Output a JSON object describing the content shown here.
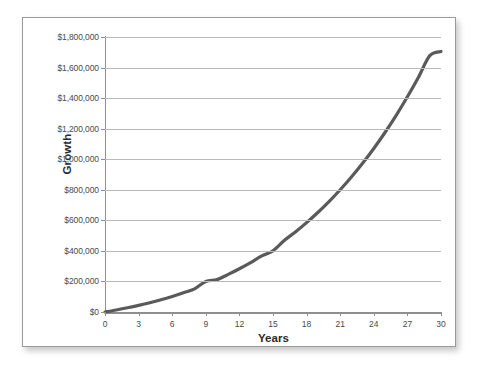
{
  "chart_data": {
    "type": "line",
    "title": "",
    "xlabel": "Years",
    "ylabel": "Growth",
    "xlim": [
      0,
      30
    ],
    "ylim": [
      0,
      1800000
    ],
    "grid": true,
    "legend": false,
    "line_color": "#5a5a5a",
    "gridline_color": "#b9b9b9",
    "axis_color": "#8f8f8f",
    "x_ticks": [
      "0",
      "3",
      "6",
      "9",
      "12",
      "15",
      "18",
      "21",
      "24",
      "27",
      "30"
    ],
    "x_tick_values": [
      0,
      3,
      6,
      9,
      12,
      15,
      18,
      21,
      24,
      27,
      30
    ],
    "y_ticks": [
      "$0",
      "$200,000",
      "$400,000",
      "$600,000",
      "$800,000",
      "$1,000,000",
      "$1,200,000",
      "$1,400,000",
      "$1,600,000",
      "$1,800,000"
    ],
    "y_tick_values": [
      0,
      200000,
      400000,
      600000,
      800000,
      1000000,
      1200000,
      1400000,
      1600000,
      1800000
    ],
    "series": [
      {
        "name": "Growth",
        "x": [
          0,
          1,
          2,
          3,
          4,
          5,
          6,
          7,
          8,
          9,
          10,
          11,
          12,
          13,
          14,
          15,
          16,
          17,
          18,
          19,
          20,
          21,
          22,
          23,
          24,
          25,
          26,
          27,
          28,
          29,
          30
        ],
        "values": [
          0,
          13000,
          27500,
          43500,
          61000,
          80500,
          102000,
          125500,
          151500,
          200000,
          212000,
          246000,
          283000,
          323500,
          367500,
          400000,
          467500,
          524000,
          585000,
          651000,
          722500,
          800000,
          883500,
          973500,
          1070500,
          1175000,
          1287500,
          1408500,
          1538500,
          1678000,
          1705000
        ]
      }
    ]
  }
}
